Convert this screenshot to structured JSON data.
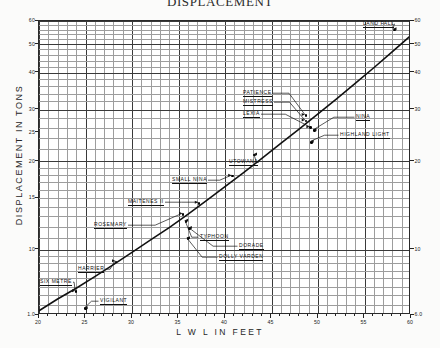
{
  "chart_title": "DISPLACEMENT",
  "axis": {
    "y_title": "DISPLACEMENT  IN  TONS",
    "x_title": "L W L   IN   FEET"
  },
  "chart_data": {
    "type": "line",
    "title": "DISPLACEMENT",
    "xlabel": "L W L  IN  FEET",
    "ylabel": "DISPLACEMENT IN TONS",
    "scale": "log-log",
    "xlim": [
      20,
      60
    ],
    "ylim": [
      6,
      60
    ],
    "grid": true,
    "legend": "none",
    "x_ticks": [
      20,
      25,
      30,
      35,
      40,
      45,
      50,
      55
    ],
    "x_ticks_right": [
      60
    ],
    "y_ticks_left": [
      "6.0",
      "10",
      "15",
      "20",
      "25",
      "30",
      "40",
      "50",
      "60"
    ],
    "y_ticks_right": [
      "6.0",
      "10",
      "20",
      "30",
      "40",
      "50",
      "60"
    ],
    "series": [
      {
        "name": "Displacement curve",
        "x": [
          20,
          22,
          24,
          26,
          28,
          30,
          32,
          34,
          36,
          38,
          40,
          42,
          44,
          46,
          48,
          50,
          52,
          54,
          56,
          58,
          60
        ],
        "y": [
          6.2,
          6.8,
          7.4,
          8.1,
          8.9,
          9.8,
          10.8,
          11.9,
          13.2,
          14.7,
          16.4,
          18.3,
          20.5,
          23.0,
          25.8,
          29.0,
          32.6,
          36.8,
          41.6,
          47.2,
          53.6
        ]
      }
    ],
    "points": [
      {
        "label": "VIGILANT",
        "x": 25.0,
        "y": 6.3
      },
      {
        "label": "SIX METRE",
        "x": 24.0,
        "y": 7.2
      },
      {
        "label": "HARRIER",
        "x": 28.3,
        "y": 9.1
      },
      {
        "label": "ROSEMARY",
        "x": 35.5,
        "y": 13.2
      },
      {
        "label": "TYPHOON",
        "x": 35.8,
        "y": 12.5
      },
      {
        "label": "DORADE",
        "x": 36.2,
        "y": 11.8
      },
      {
        "label": "DOLLY VARDEN",
        "x": 36.0,
        "y": 10.9
      },
      {
        "label": "MAITENES II",
        "x": 37.2,
        "y": 14.4
      },
      {
        "label": "SMALL NINA",
        "x": 40.8,
        "y": 17.8
      },
      {
        "label": "UTOWANA",
        "x": 43.2,
        "y": 21.0
      },
      {
        "label": "PATIENCE",
        "x": 48.7,
        "y": 28.6
      },
      {
        "label": "MISTRESS",
        "x": 48.7,
        "y": 27.4
      },
      {
        "label": "LEXIA",
        "x": 49.2,
        "y": 26.0
      },
      {
        "label": "NINA",
        "x": 49.6,
        "y": 25.4
      },
      {
        "label": "HIGHLAND LIGHT",
        "x": 49.3,
        "y": 23.2
      },
      {
        "label": "LAND FALL",
        "x": 58.2,
        "y": 56.0
      }
    ],
    "annotations": [
      "LAND FALL",
      "PATIENCE",
      "MISTRESS",
      "LEXIA",
      "NINA",
      "HIGHLAND LIGHT",
      "UTOWANA",
      "SMALL NINA",
      "MAITENES II",
      "ROSEMARY",
      "TYPHOON",
      "DORADE",
      "DOLLY VARDEN",
      "HARRIER",
      "SIX METRE",
      "VIGILANT"
    ]
  },
  "ticks": {
    "x": [
      {
        "label": "20",
        "value": 20
      },
      {
        "label": "25",
        "value": 25
      },
      {
        "label": "30",
        "value": 30
      },
      {
        "label": "35",
        "value": 35
      },
      {
        "label": "40",
        "value": 40
      },
      {
        "label": "45",
        "value": 45
      },
      {
        "label": "50",
        "value": 50
      },
      {
        "label": "55",
        "value": 55
      },
      {
        "label": "60",
        "value": 60
      }
    ],
    "y_left": [
      {
        "label": "60",
        "value": 60
      },
      {
        "label": "50",
        "value": 50
      },
      {
        "label": "40",
        "value": 40
      },
      {
        "label": "30",
        "value": 30
      },
      {
        "label": "25",
        "value": 25
      },
      {
        "label": "20",
        "value": 20
      },
      {
        "label": "15",
        "value": 15
      },
      {
        "label": "10",
        "value": 10
      },
      {
        "label": "1.0",
        "value": 6.0
      }
    ],
    "y_right": [
      {
        "label": "60",
        "value": 60
      },
      {
        "label": "50",
        "value": 50
      },
      {
        "label": "40",
        "value": 40
      },
      {
        "label": "30",
        "value": 30
      },
      {
        "label": "20",
        "value": 20
      },
      {
        "label": "10",
        "value": 10
      },
      {
        "label": "6.0",
        "value": 6.0
      }
    ]
  },
  "labels": {
    "land_fall": "LAND FALL",
    "patience": "PATIENCE",
    "mistress": "MISTRESS",
    "lexia": "LEXIA",
    "nina": "NINA",
    "highland_light": "HIGHLAND LIGHT",
    "utowana": "UTOWANA",
    "small_nina": "SMALL NINA",
    "maitenes_ii": "MAITENES II",
    "rosemary": "ROSEMARY",
    "typhoon": "TYPHOON",
    "dorade": "DORADE",
    "dolly_varden": "DOLLY VARDEN",
    "harrier": "HARRIER",
    "six_metre": "SIX METRE",
    "vigilant": "VIGILANT"
  },
  "colors": {
    "ink": "#1a1a1a",
    "grid_minor": "#9d9d9d",
    "grid_major": "#3a3a3a",
    "paper": "#fbfbfa",
    "plot_bg": "#ffffff"
  }
}
